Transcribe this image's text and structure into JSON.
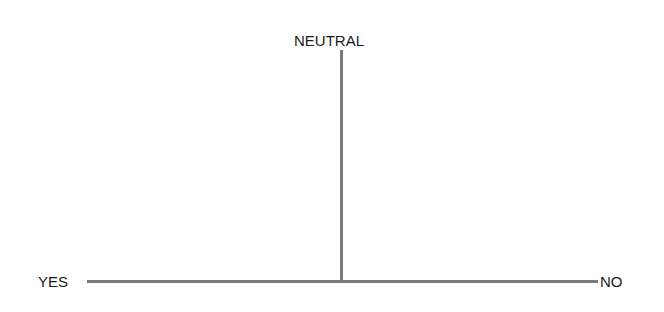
{
  "diagram": {
    "type": "t-axis",
    "labels": {
      "top": "NEUTRAL",
      "left": "YES",
      "right": "NO"
    },
    "line_color": "#7a7a7a"
  }
}
